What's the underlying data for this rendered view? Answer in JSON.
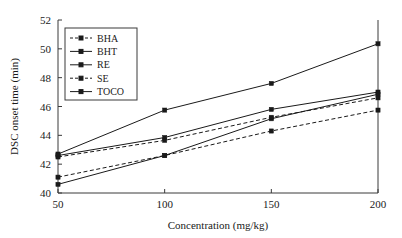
{
  "chart_data": {
    "type": "line",
    "title": "",
    "xlabel": "Concentration (mg/kg)",
    "ylabel": "DSC onset time (min)",
    "x": [
      50,
      100,
      150,
      200
    ],
    "xtick_labels": [
      "50",
      "100",
      "150",
      "200"
    ],
    "ytick_labels": [
      "40",
      "42",
      "44",
      "46",
      "48",
      "50",
      "52"
    ],
    "xlim": [
      50,
      200
    ],
    "ylim": [
      40,
      52
    ],
    "ytick_step": 2,
    "grid": false,
    "legend_position": "upper-left-inside",
    "series": [
      {
        "name": "BHA",
        "values": [
          41.1,
          42.6,
          44.3,
          45.75
        ],
        "style": "dashed",
        "marker": "square",
        "color": "#1a1a1a"
      },
      {
        "name": "BHT",
        "values": [
          42.6,
          43.85,
          45.8,
          47.0
        ],
        "style": "solid",
        "marker": "square",
        "color": "#1a1a1a"
      },
      {
        "name": "RE",
        "values": [
          40.6,
          42.6,
          45.15,
          46.85
        ],
        "style": "solid",
        "marker": "square",
        "color": "#1a1a1a"
      },
      {
        "name": "SE",
        "values": [
          42.5,
          43.65,
          45.25,
          46.6
        ],
        "style": "dashed",
        "marker": "square",
        "color": "#1a1a1a"
      },
      {
        "name": "TOCO",
        "values": [
          42.7,
          45.75,
          47.6,
          50.35
        ],
        "style": "solid",
        "marker": "square",
        "color": "#1a1a1a"
      }
    ]
  },
  "figure": {
    "background_color": "#ffffff",
    "axis_color": "#3a3a3a",
    "text_color": "#1a1a1a"
  }
}
